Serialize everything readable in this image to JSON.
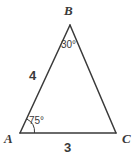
{
  "figure": {
    "type": "geometry-diagram",
    "background_color": "#ffffff",
    "stroke_color": "#3a3a3a",
    "text_color": "#3a3a3a",
    "vertices": [
      {
        "name": "A",
        "label": "A",
        "x": 20,
        "y": 133
      },
      {
        "name": "B",
        "label": "B",
        "x": 70,
        "y": 25
      },
      {
        "name": "C",
        "label": "C",
        "x": 116,
        "y": 133
      }
    ],
    "sides": [
      {
        "name": "AB",
        "label": "4",
        "from": "A",
        "to": "B"
      },
      {
        "name": "AC",
        "label": "3",
        "from": "A",
        "to": "C"
      },
      {
        "name": "BC",
        "label": "",
        "from": "B",
        "to": "C"
      }
    ],
    "angles": [
      {
        "at": "B",
        "label": "30°",
        "value": 30,
        "arc": false
      },
      {
        "at": "A",
        "label": "75°",
        "value": 75,
        "arc": true
      }
    ]
  }
}
